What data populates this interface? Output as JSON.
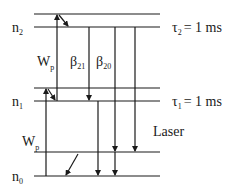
{
  "diagram": {
    "levels": {
      "n2": {
        "label": "n",
        "sub": "2",
        "tau_label": "τ",
        "tau_sub": "2",
        "tau_value": "= 1 ms"
      },
      "n1": {
        "label": "n",
        "sub": "1",
        "tau_label": "τ",
        "tau_sub": "1",
        "tau_value": "= 1 ms"
      },
      "n0": {
        "label": "n",
        "sub": "0"
      }
    },
    "transitions": {
      "pump_upper": {
        "label": "W",
        "sub": "p"
      },
      "pump_lower": {
        "label": "W",
        "sub": "p"
      },
      "beta21": {
        "label": "β",
        "sub": "21"
      },
      "beta20": {
        "label": "β",
        "sub": "20"
      },
      "laser": {
        "label": "Laser"
      }
    },
    "colors": {
      "line": "#1a1a1a",
      "background": "#ffffff"
    }
  }
}
